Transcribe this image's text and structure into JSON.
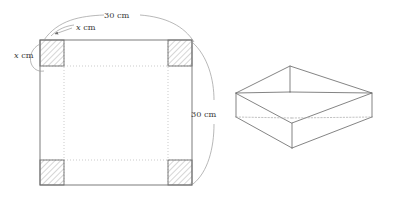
{
  "figure": {
    "colors": {
      "line": "#6e6e6e",
      "thin_line": "#9a9a9a",
      "dotted_line": "#b5b5b5",
      "hatch_stroke": "#7a7a7a",
      "hidden_edge": "#a8a8a8",
      "label_text": "#3a3a3a",
      "background": "#ffffff"
    },
    "net": {
      "name": "square-sheet-net",
      "sheet_side_cm": 30,
      "corner_cut_cm": "x",
      "labels": {
        "top_dimension": {
          "value": "30",
          "unit": "cm",
          "text": "30 cm"
        },
        "right_dimension": {
          "value": "30",
          "unit": "cm",
          "text": "30 cm"
        },
        "corner_width": {
          "variable": "x",
          "unit": "cm",
          "text": "x cm"
        },
        "corner_height": {
          "variable": "x",
          "unit": "cm",
          "text": "x cm"
        }
      },
      "corner_squares": [
        {
          "position": "top-left",
          "hatched": true
        },
        {
          "position": "top-right",
          "hatched": true
        },
        {
          "position": "bottom-left",
          "hatched": true
        },
        {
          "position": "bottom-right",
          "hatched": true
        }
      ],
      "fold_lines": "dotted"
    },
    "box": {
      "name": "open-top-box",
      "open_top": true,
      "hidden_edges": "dotted",
      "visible_faces": [
        "front-left",
        "front-right",
        "inner-base"
      ]
    }
  }
}
